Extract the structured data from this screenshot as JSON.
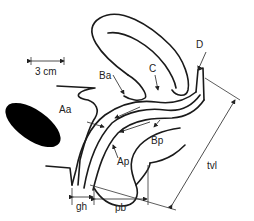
{
  "diagram": {
    "type": "anatomical-sagittal-pelvic-diagram",
    "scale_bar": {
      "label": "3 cm"
    },
    "points": {
      "Aa": "Aa",
      "Ba": "Ba",
      "C": "C",
      "D": "D",
      "Ap": "Ap",
      "Bp": "Bp"
    },
    "measurements": {
      "gh": "gh",
      "pb": "pb",
      "tvl": "tvl"
    },
    "colors": {
      "line": "#1a1a1a",
      "fill_dark": "#000000",
      "background": "#ffffff"
    }
  }
}
